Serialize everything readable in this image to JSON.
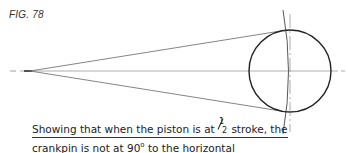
{
  "figure": {
    "label": "FIG. 78",
    "caption": {
      "line1_before": "Showing that when the piston is at ",
      "fraction_num": "1",
      "fraction_den": "2",
      "line1_after": " stroke, the",
      "line2_before": "crankpin is not at 90",
      "degree": "o",
      "line2_after": " to the horizontal"
    }
  },
  "geometry": {
    "crankpin": {
      "x": 28,
      "y": 71
    },
    "circle": {
      "cx": 290,
      "cy": 71,
      "r": 41
    },
    "centerline_y": 71,
    "colors": {
      "stroke": "#222222",
      "thin": "#777777"
    }
  }
}
